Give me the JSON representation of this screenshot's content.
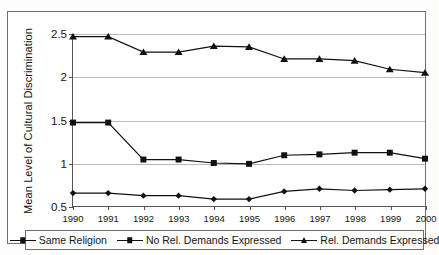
{
  "chart_data": {
    "type": "line",
    "title": "",
    "xlabel": "",
    "ylabel": "Mean Level of Cultural Discrimination",
    "categories": [
      "1990",
      "1991",
      "1992",
      "1993",
      "1994",
      "1995",
      "1996",
      "1997",
      "1998",
      "1999",
      "2000"
    ],
    "x": [
      1990,
      1991,
      1992,
      1993,
      1994,
      1995,
      1996,
      1997,
      1998,
      1999,
      2000
    ],
    "ylim": [
      0.5,
      2.5
    ],
    "yticks": [
      "0.5",
      "1",
      "1.5",
      "2",
      "2.5"
    ],
    "ytick_values": [
      0.5,
      1,
      1.5,
      2,
      2.5
    ],
    "grid": "horizontal",
    "legend_position": "bottom",
    "series": [
      {
        "name": "Same Religion",
        "marker": "diamond",
        "values": [
          0.65,
          0.65,
          0.62,
          0.62,
          0.58,
          0.58,
          0.67,
          0.7,
          0.68,
          0.69,
          0.7
        ]
      },
      {
        "name": "No Rel. Demands Expressed",
        "marker": "square",
        "values": [
          1.47,
          1.47,
          1.04,
          1.04,
          1.0,
          0.99,
          1.09,
          1.1,
          1.12,
          1.12,
          1.05
        ]
      },
      {
        "name": "Rel. Demands Expressed",
        "marker": "triangle",
        "values": [
          2.47,
          2.47,
          2.29,
          2.29,
          2.36,
          2.35,
          2.21,
          2.21,
          2.19,
          2.09,
          2.05
        ]
      }
    ],
    "colors": {
      "series_line": "#111111",
      "gridline": "#b9b9b9",
      "axis": "#555555",
      "frame": "#6e6e6e",
      "background": "#ffffff"
    }
  }
}
